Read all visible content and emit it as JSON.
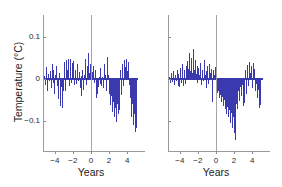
{
  "figure": {
    "background": "#ffffff",
    "series_color": "#3a39ad",
    "axis_color": "#9a9a9a",
    "zero_line_color": "#a6a6a6"
  },
  "chart_data": [
    {
      "type": "bar",
      "panel": "left",
      "title": "",
      "xlabel": "Years",
      "ylabel": "Temperature (°C)",
      "xlim": [
        -5.2,
        5.2
      ],
      "ylim": [
        -0.155,
        0.135
      ],
      "xticks": [
        -4,
        -2,
        0,
        2,
        4
      ],
      "xtick_labels": [
        "−4",
        "−2",
        "0",
        "2",
        "4"
      ],
      "yticks": [
        0.1,
        0,
        -0.1
      ],
      "ytick_labels": [
        "0.1",
        "0",
        "−0.1"
      ],
      "grid": false,
      "legend": "none",
      "reference_line_x": 0,
      "x": [
        -5.1,
        -5.0,
        -4.9,
        -4.8,
        -4.7,
        -4.6,
        -4.5,
        -4.4,
        -4.3,
        -4.2,
        -4.1,
        -4.0,
        -3.9,
        -3.8,
        -3.7,
        -3.6,
        -3.5,
        -3.4,
        -3.3,
        -3.2,
        -3.1,
        -3.0,
        -2.9,
        -2.8,
        -2.7,
        -2.6,
        -2.5,
        -2.4,
        -2.3,
        -2.2,
        -2.1,
        -2.0,
        -1.9,
        -1.8,
        -1.7,
        -1.6,
        -1.5,
        -1.4,
        -1.3,
        -1.2,
        -1.1,
        -1.0,
        -0.9,
        -0.8,
        -0.7,
        -0.6,
        -0.5,
        -0.4,
        -0.3,
        -0.2,
        -0.1,
        0.0,
        0.1,
        0.2,
        0.3,
        0.4,
        0.5,
        0.6,
        0.7,
        0.8,
        0.9,
        1.0,
        1.1,
        1.2,
        1.3,
        1.4,
        1.5,
        1.6,
        1.7,
        1.8,
        1.9,
        2.0,
        2.1,
        2.2,
        2.3,
        2.4,
        2.5,
        2.6,
        2.7,
        2.8,
        2.9,
        3.0,
        3.1,
        3.2,
        3.3,
        3.4,
        3.5,
        3.6,
        3.7,
        3.8,
        3.9,
        4.0,
        4.1,
        4.2,
        4.3,
        4.4,
        4.5,
        4.6,
        4.7,
        4.8,
        4.9,
        5.0,
        5.1
      ],
      "values": [
        0.006,
        -0.014,
        0.028,
        -0.03,
        0.012,
        -0.005,
        0.018,
        -0.022,
        0.034,
        -0.009,
        0.021,
        -0.036,
        0.01,
        0.03,
        -0.018,
        -0.048,
        0.014,
        -0.064,
        -0.02,
        -0.07,
        -0.044,
        -0.03,
        0.04,
        -0.028,
        0.044,
        0.02,
        0.046,
        -0.016,
        0.048,
        -0.01,
        0.038,
        0.012,
        0.042,
        -0.014,
        0.02,
        -0.012,
        0.034,
        -0.006,
        0.016,
        -0.022,
        0.006,
        -0.042,
        0.02,
        -0.026,
        0.01,
        0.046,
        -0.014,
        0.03,
        0.062,
        0.014,
        0.036,
        0.098,
        0.042,
        0.016,
        0.03,
        -0.01,
        0.02,
        -0.046,
        -0.036,
        -0.02,
        0.004,
        -0.012,
        0.026,
        -0.018,
        0.004,
        -0.022,
        0.034,
        0.008,
        -0.03,
        0.052,
        0.01,
        -0.02,
        -0.036,
        -0.062,
        -0.04,
        -0.078,
        -0.056,
        -0.09,
        -0.07,
        -0.102,
        -0.06,
        -0.084,
        -0.046,
        -0.074,
        0.022,
        -0.038,
        0.036,
        -0.016,
        0.044,
        0.028,
        0.046,
        0.018,
        0.04,
        0.012,
        -0.014,
        -0.046,
        -0.09,
        -0.06,
        -0.11,
        -0.084,
        -0.126,
        -0.118
      ]
    },
    {
      "type": "bar",
      "panel": "right",
      "title": "",
      "xlabel": "Years",
      "ylabel": "",
      "xlim": [
        -5.2,
        5.2
      ],
      "ylim": [
        -0.155,
        0.135
      ],
      "xticks": [
        -4,
        -2,
        0,
        2,
        4
      ],
      "xtick_labels": [
        "−4",
        "−2",
        "0",
        "2",
        "4"
      ],
      "yticks": [
        0.1,
        0,
        -0.1
      ],
      "ytick_labels": [
        "",
        "",
        ""
      ],
      "grid": false,
      "legend": "none",
      "reference_line_x": 0,
      "x": [
        -5.1,
        -5.0,
        -4.9,
        -4.8,
        -4.7,
        -4.6,
        -4.5,
        -4.4,
        -4.3,
        -4.2,
        -4.1,
        -4.0,
        -3.9,
        -3.8,
        -3.7,
        -3.6,
        -3.5,
        -3.4,
        -3.3,
        -3.2,
        -3.1,
        -3.0,
        -2.9,
        -2.8,
        -2.7,
        -2.6,
        -2.5,
        -2.4,
        -2.3,
        -2.2,
        -2.1,
        -2.0,
        -1.9,
        -1.8,
        -1.7,
        -1.6,
        -1.5,
        -1.4,
        -1.3,
        -1.2,
        -1.1,
        -1.0,
        -0.9,
        -0.8,
        -0.7,
        -0.6,
        -0.5,
        -0.4,
        -0.3,
        -0.2,
        -0.1,
        0.0,
        0.1,
        0.2,
        0.3,
        0.4,
        0.5,
        0.6,
        0.7,
        0.8,
        0.9,
        1.0,
        1.1,
        1.2,
        1.3,
        1.4,
        1.5,
        1.6,
        1.7,
        1.8,
        1.9,
        2.0,
        2.1,
        2.2,
        2.3,
        2.4,
        2.5,
        2.6,
        2.7,
        2.8,
        2.9,
        3.0,
        3.1,
        3.2,
        3.3,
        3.4,
        3.5,
        3.6,
        3.7,
        3.8,
        3.9,
        4.0,
        4.1,
        4.2,
        4.3,
        4.4,
        4.5,
        4.6,
        4.7,
        4.8,
        4.9,
        5.0,
        5.1
      ],
      "values": [
        0.004,
        -0.01,
        0.014,
        -0.008,
        0.018,
        -0.014,
        0.01,
        -0.006,
        0.022,
        -0.016,
        0.012,
        -0.02,
        0.026,
        -0.01,
        0.034,
        -0.018,
        0.02,
        -0.012,
        0.03,
        0.016,
        0.042,
        0.024,
        0.062,
        0.018,
        0.05,
        0.014,
        0.07,
        0.02,
        0.044,
        0.012,
        0.03,
        -0.01,
        0.026,
        0.008,
        0.038,
        -0.014,
        0.022,
        -0.006,
        0.044,
        0.01,
        0.018,
        -0.022,
        0.03,
        -0.012,
        0.036,
        0.014,
        0.024,
        -0.056,
        0.02,
        0.008,
        0.028,
        0.046,
        -0.018,
        -0.034,
        -0.028,
        -0.046,
        -0.038,
        -0.056,
        -0.044,
        -0.064,
        -0.05,
        -0.072,
        -0.058,
        -0.084,
        -0.066,
        -0.092,
        -0.074,
        -0.104,
        -0.082,
        -0.116,
        -0.09,
        -0.13,
        -0.1,
        -0.146,
        -0.06,
        -0.072,
        -0.03,
        -0.054,
        -0.02,
        -0.04,
        -0.014,
        -0.064,
        -0.026,
        -0.058,
        0.02,
        -0.036,
        0.032,
        -0.018,
        0.04,
        0.014,
        0.03,
        -0.022,
        0.038,
        0.006,
        0.024,
        -0.03,
        -0.012,
        -0.046,
        -0.026,
        -0.07,
        -0.062
      ]
    }
  ]
}
